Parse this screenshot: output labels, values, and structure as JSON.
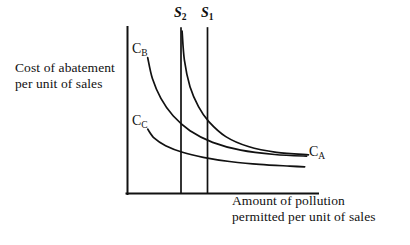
{
  "figure": {
    "background_color": "#ffffff",
    "ink_color": "#111111",
    "width": 410,
    "height": 245
  },
  "axes": {
    "y_caption_line1": "Cost of abatement",
    "y_caption_line2": "per unit of sales",
    "x_caption_line1": "Amount of pollution",
    "x_caption_line2": "permitted per unit of sales"
  },
  "curve_labels": {
    "c_a_base": "C",
    "c_a_sub": "A",
    "c_b_base": "C",
    "c_b_sub": "B",
    "c_c_base": "C",
    "c_c_sub": "C"
  },
  "shock_labels": {
    "s1_base": "S",
    "s1_sub": "1",
    "s2_base": "S",
    "s2_sub": "2"
  },
  "chart_data": {
    "type": "line",
    "title": "",
    "xlabel": "Amount of pollution permitted per unit of sales",
    "ylabel": "Cost of abatement per unit of sales",
    "grid": false,
    "legend": "inline-curve-labels",
    "axis_style": "two-line L-shaped axes, no tick marks, no numeric scale",
    "xlim": [
      0,
      1
    ],
    "ylim": [
      0,
      1
    ],
    "vertical_lines": [
      {
        "name": "S2",
        "label": "S₂",
        "x_fraction": 0.282,
        "description": "tighter pollution permit standard (leftward supply/standard line)"
      },
      {
        "name": "S1",
        "label": "S₁",
        "x_fraction": 0.423,
        "description": "original pollution permit standard"
      }
    ],
    "series": [
      {
        "name": "C_A",
        "label": "Cₐ",
        "description": "highest marginal abatement cost curve; steepest, begins at top of the S2 line and falls convexly to the right",
        "points_fraction": [
          {
            "x": 0.288,
            "y": 0.975
          },
          {
            "x": 0.3,
            "y": 0.8
          },
          {
            "x": 0.33,
            "y": 0.64
          },
          {
            "x": 0.375,
            "y": 0.52
          },
          {
            "x": 0.43,
            "y": 0.43
          },
          {
            "x": 0.52,
            "y": 0.34
          },
          {
            "x": 0.64,
            "y": 0.28
          },
          {
            "x": 0.79,
            "y": 0.245
          },
          {
            "x": 0.96,
            "y": 0.23
          }
        ]
      },
      {
        "name": "C_B",
        "label": "Cʙ",
        "description": "intermediate marginal abatement cost curve; begins left of the S2 line and falls convexly to the right",
        "points_fraction": [
          {
            "x": 0.105,
            "y": 0.815
          },
          {
            "x": 0.13,
            "y": 0.69
          },
          {
            "x": 0.175,
            "y": 0.57
          },
          {
            "x": 0.24,
            "y": 0.465
          },
          {
            "x": 0.33,
            "y": 0.375
          },
          {
            "x": 0.45,
            "y": 0.305
          },
          {
            "x": 0.6,
            "y": 0.258
          },
          {
            "x": 0.78,
            "y": 0.232
          },
          {
            "x": 0.95,
            "y": 0.222
          }
        ]
      },
      {
        "name": "C_C",
        "label": "Cᴄ",
        "description": "lowest and flattest marginal abatement cost curve",
        "points_fraction": [
          {
            "x": 0.105,
            "y": 0.385
          },
          {
            "x": 0.14,
            "y": 0.33
          },
          {
            "x": 0.2,
            "y": 0.285
          },
          {
            "x": 0.29,
            "y": 0.245
          },
          {
            "x": 0.4,
            "y": 0.215
          },
          {
            "x": 0.54,
            "y": 0.19
          },
          {
            "x": 0.7,
            "y": 0.172
          },
          {
            "x": 0.86,
            "y": 0.162
          },
          {
            "x": 0.94,
            "y": 0.158
          }
        ]
      }
    ]
  }
}
